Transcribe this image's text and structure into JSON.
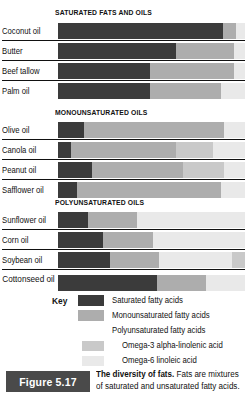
{
  "figure": {
    "badge": "Figure 5.17",
    "caption_bold": "The diversity of fats.",
    "caption_rest": " Fats are mixtures of saturated and unsaturated fatty acids."
  },
  "colors": {
    "saturated": "#3b3b3b",
    "monounsaturated": "#adadad",
    "polyunsaturated": "#d4d4d4",
    "omega3": "#c9c9c9",
    "omega6": "#e9e9e9"
  },
  "key": {
    "title": "Key",
    "items": [
      {
        "label": "Saturated fatty acids",
        "swatch": "saturated",
        "indent": false,
        "has_swatch": true
      },
      {
        "label": "Monounsaturated fatty acids",
        "swatch": "monounsaturated",
        "indent": false,
        "has_swatch": true
      },
      {
        "label": "Polyunsaturated fatty acids",
        "swatch": "polyunsaturated",
        "indent": false,
        "has_swatch": false
      },
      {
        "label": "Omega-3 alpha-linolenic acid",
        "swatch": "omega3",
        "indent": true,
        "has_swatch": true
      },
      {
        "label": "Omega-6 linoleic acid",
        "swatch": "omega6",
        "indent": true,
        "has_swatch": true
      }
    ]
  },
  "chart_data": {
    "type": "bar",
    "subtype": "stacked-horizontal-100%",
    "title": "The diversity of fats",
    "xlabel": "",
    "ylabel": "",
    "xlim": [
      0,
      100
    ],
    "grid": false,
    "legend_position": "bottom",
    "legend": [
      "Saturated fatty acids",
      "Monounsaturated fatty acids",
      "Polyunsaturated fatty acids",
      "Omega-3 alpha-linolenic acid",
      "Omega-6 linoleic acid"
    ],
    "series_names": [
      "Saturated",
      "Monounsaturated",
      "Omega-3 alpha-linolenic",
      "Omega-6 linoleic"
    ],
    "groups": [
      {
        "title": "SATURATED FATS AND OILS",
        "categories": [
          "Coconut oil",
          "Butter",
          "Beef tallow",
          "Palm oil"
        ],
        "rows": [
          {
            "label": "Coconut oil",
            "segments": [
              {
                "kind": "sat",
                "pct": 88
              },
              {
                "kind": "mono",
                "pct": 7
              },
              {
                "kind": "o6",
                "pct": 5
              }
            ]
          },
          {
            "label": "Butter",
            "segments": [
              {
                "kind": "sat",
                "pct": 63
              },
              {
                "kind": "mono",
                "pct": 31
              },
              {
                "kind": "o6",
                "pct": 6
              }
            ]
          },
          {
            "label": "Beef tallow",
            "segments": [
              {
                "kind": "sat",
                "pct": 49
              },
              {
                "kind": "mono",
                "pct": 45
              },
              {
                "kind": "o6",
                "pct": 6
              }
            ]
          },
          {
            "label": "Palm oil",
            "segments": [
              {
                "kind": "sat",
                "pct": 49
              },
              {
                "kind": "mono",
                "pct": 38
              },
              {
                "kind": "o6",
                "pct": 13
              }
            ]
          }
        ]
      },
      {
        "title": "MONOUNSATURATED OILS",
        "categories": [
          "Olive oil",
          "Canola oil",
          "Peanut oil",
          "Safflower oil"
        ],
        "rows": [
          {
            "label": "Olive oil",
            "segments": [
              {
                "kind": "sat",
                "pct": 14
              },
              {
                "kind": "mono",
                "pct": 75
              },
              {
                "kind": "o6",
                "pct": 11
              }
            ]
          },
          {
            "label": "Canola oil",
            "segments": [
              {
                "kind": "sat",
                "pct": 7
              },
              {
                "kind": "mono",
                "pct": 56
              },
              {
                "kind": "o3",
                "pct": 20
              },
              {
                "kind": "o6",
                "pct": 17
              }
            ]
          },
          {
            "label": "Peanut oil",
            "segments": [
              {
                "kind": "sat",
                "pct": 18
              },
              {
                "kind": "mono",
                "pct": 49
              },
              {
                "kind": "o3",
                "pct": 22
              },
              {
                "kind": "o6",
                "pct": 11
              }
            ]
          },
          {
            "label": "Safflower oil",
            "segments": [
              {
                "kind": "sat",
                "pct": 10
              },
              {
                "kind": "mono",
                "pct": 77
              },
              {
                "kind": "o6",
                "pct": 13
              }
            ]
          }
        ]
      },
      {
        "title": "POLYUNSATURATED OILS",
        "categories": [
          "Sunflower oil",
          "Corn oil",
          "Soybean oil",
          "Cottonseed oil"
        ],
        "rows": [
          {
            "label": "Sunflower oil",
            "segments": [
              {
                "kind": "sat",
                "pct": 16
              },
              {
                "kind": "mono",
                "pct": 26
              },
              {
                "kind": "o6",
                "pct": 58
              }
            ]
          },
          {
            "label": "Corn oil",
            "segments": [
              {
                "kind": "sat",
                "pct": 24
              },
              {
                "kind": "mono",
                "pct": 27
              },
              {
                "kind": "o6",
                "pct": 49
              }
            ]
          },
          {
            "label": "Soybean oil",
            "segments": [
              {
                "kind": "sat",
                "pct": 28
              },
              {
                "kind": "mono",
                "pct": 26
              },
              {
                "kind": "o6",
                "pct": 39
              },
              {
                "kind": "o3",
                "pct": 7
              }
            ]
          },
          {
            "label": "Cottonseed oil",
            "segments": [
              {
                "kind": "sat",
                "pct": 53
              },
              {
                "kind": "mono",
                "pct": 26
              },
              {
                "kind": "o6",
                "pct": 21
              }
            ]
          }
        ]
      }
    ]
  }
}
